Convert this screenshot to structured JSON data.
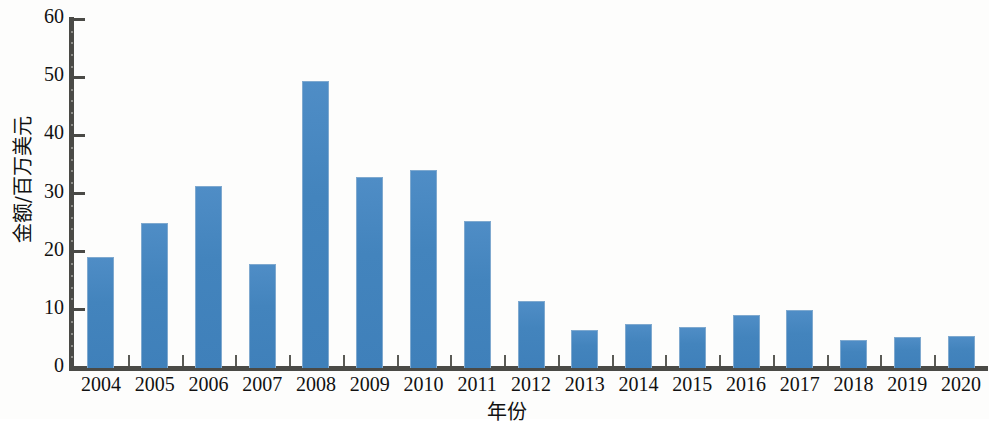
{
  "chart_data": {
    "type": "bar",
    "title": "",
    "xlabel": "年份",
    "ylabel": "金额/百万美元",
    "categories": [
      "2004",
      "2005",
      "2006",
      "2007",
      "2008",
      "2009",
      "2010",
      "2011",
      "2012",
      "2013",
      "2014",
      "2015",
      "2016",
      "2017",
      "2018",
      "2019",
      "2020"
    ],
    "values": [
      19.0,
      25.0,
      31.3,
      17.8,
      49.3,
      32.8,
      34.1,
      25.2,
      11.6,
      6.6,
      7.5,
      7.0,
      9.2,
      9.9,
      4.8,
      5.4,
      5.5
    ],
    "ylim": [
      0,
      60
    ],
    "yticks": [
      0,
      10,
      20,
      30,
      40,
      50,
      60
    ],
    "ytick_labels": [
      "0",
      "10",
      "20",
      "30",
      "40",
      "50",
      "60"
    ],
    "grid": false,
    "legend": "none",
    "series_color": "#4384bd",
    "axis_color": "#4a4a46",
    "background": "#fdfdfc"
  }
}
